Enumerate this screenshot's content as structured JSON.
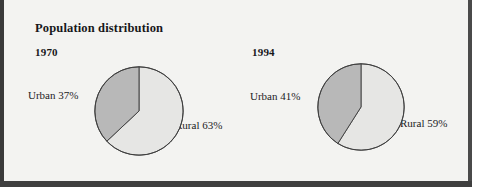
{
  "figure": {
    "title": "Population distribution",
    "charts": [
      {
        "year_label": "1970",
        "urban_label": "Urban 37%",
        "rural_label": "Rural 63%"
      },
      {
        "year_label": "1994",
        "urban_label": "Urban 41%",
        "rural_label": "Rural 59%"
      }
    ]
  },
  "chart_data": [
    {
      "type": "pie",
      "title": "1970",
      "categories": [
        "Urban",
        "Rural"
      ],
      "values": [
        37,
        63
      ],
      "labels": [
        "Urban 37%",
        "Rural 63%"
      ],
      "units": "percent",
      "colors": [
        "#b8b8b8",
        "#e6e6e4"
      ],
      "start_angle_deg": 0,
      "direction": "counterclockwise",
      "legend": "none",
      "grid": false
    },
    {
      "type": "pie",
      "title": "1994",
      "categories": [
        "Urban",
        "Rural"
      ],
      "values": [
        41,
        59
      ],
      "labels": [
        "Urban 41%",
        "Rural 59%"
      ],
      "units": "percent",
      "colors": [
        "#b8b8b8",
        "#e6e6e4"
      ],
      "start_angle_deg": 0,
      "direction": "counterclockwise",
      "legend": "none",
      "grid": false
    }
  ],
  "style": {
    "urban_fill": "#b8b8b8",
    "rural_fill": "#e6e6e4",
    "outline": "#3c3c3c",
    "panel_background": "#f3f3f1",
    "text_color": "#17171a"
  }
}
